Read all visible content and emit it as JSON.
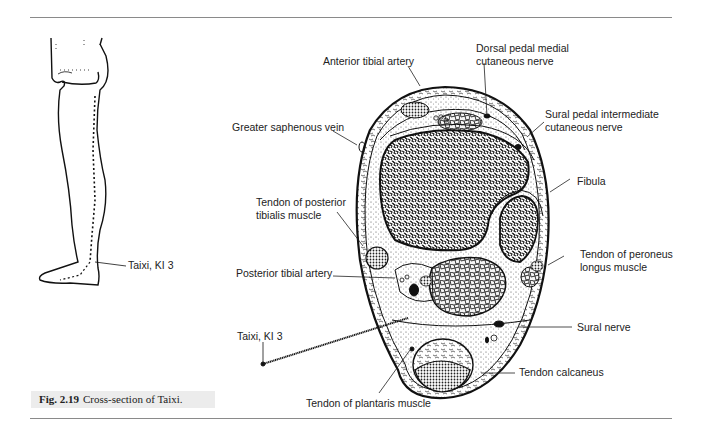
{
  "figure": {
    "number": "Fig. 2.19",
    "caption": "Cross-section of Taixi."
  },
  "leg_illustration": {
    "point_label": "Taixi, KI 3"
  },
  "cross_section": {
    "labels": {
      "anterior_tibial_artery": "Anterior tibial artery",
      "dorsal_pedal_medial_line1": "Dorsal pedal medial",
      "dorsal_pedal_medial_line2": "cutaneous nerve",
      "greater_saphenous_vein": "Greater saphenous vein",
      "sural_pedal_intermediate_line1": "Sural pedal intermediate",
      "sural_pedal_intermediate_line2": "cutaneous nerve",
      "fibula": "Fibula",
      "tendon_posterior_tibialis_line1": "Tendon of posterior",
      "tendon_posterior_tibialis_line2": "tibialis muscle",
      "tendon_peroneus_longus_line1": "Tendon of peroneus",
      "tendon_peroneus_longus_line2": "longus muscle",
      "posterior_tibial_artery": "Posterior tibial artery",
      "sural_nerve": "Sural nerve",
      "needle_point": "Taixi, KI 3",
      "tendon_calcaneus": "Tendon calcaneus",
      "tendon_plantaris": "Tendon of plantaris muscle"
    }
  },
  "colors": {
    "rule": "#8a8a8a",
    "caption_bg": "#ececec",
    "ink": "#111111"
  }
}
